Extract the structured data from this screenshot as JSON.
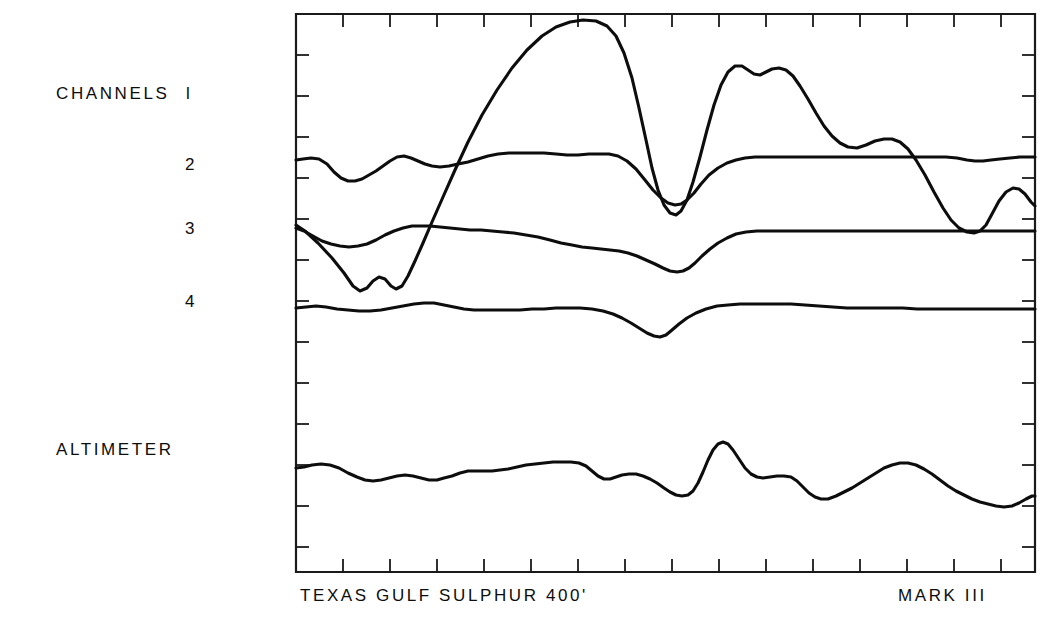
{
  "figure": {
    "kind": "multi-trace-strip-chart",
    "background_color": "#ffffff",
    "trace_color": "#0d0d0d"
  },
  "labels": {
    "channels_group": "CHANNELS",
    "channel_1": "l",
    "channel_2": "2",
    "channel_3": "3",
    "channel_4": "4",
    "altimeter": "ALTIMETER",
    "site_caption": "TEXAS  GULF  SULPHUR   400'",
    "system_caption": "MARK  III"
  },
  "chart_data": {
    "type": "line",
    "title": "",
    "subtitle": "",
    "xlabel": "TEXAS  GULF  SULPHUR   400'",
    "ylabel": "",
    "annotations": [
      "TEXAS  GULF  SULPHUR   400'",
      "MARK  III"
    ],
    "grid": false,
    "legend_position": "left-outside",
    "axes": {
      "frame": {
        "x0": 296,
        "y0": 14,
        "x1": 1035,
        "y1": 572
      },
      "x_ticks_count": 15,
      "x_tick_spacing_px": 47,
      "x_tick_direction": "inward-up",
      "y_ticks_count": 13,
      "y_tick_spacing_px": 41,
      "y_tick_direction": "inward-right",
      "xlim": [
        0,
        1
      ],
      "ylim": [
        0,
        1
      ],
      "tick_labels_x": [],
      "tick_labels_y": []
    },
    "legend_entries": [
      "CHANNELS l",
      "2",
      "3",
      "4",
      "ALTIMETER"
    ],
    "series": [
      {
        "name": "CHANNELS l",
        "baseline_y_px": 225,
        "path": "M296,225 L305,231 L318,243 L332,258 L344,273 L353,286 L360,291 L367,288 L373,281 L379,277 L385,279 L391,286 L396,289 L402,286 L408,276 L415,261 L423,243 L432,222 L443,197 L455,170 L468,142 L482,115 L497,90 L512,68 L527,50 L542,36 L556,27 L570,22 L583,20 L596,21 L607,26 L616,36 L624,53 L632,78 L639,108 L646,140 L652,168 L658,190 L664,205 L670,213 L676,215 L681,211 L687,200 L693,182 L700,157 L707,130 L714,105 L721,85 L728,72 L735,66 L742,66 L748,70 L754,74 L760,75 L766,72 L772,69 L779,68 L786,70 L793,76 L800,86 L808,99 L816,113 L824,126 L832,136 L840,143 L848,147 L857,148 L866,145 L875,141 L884,139 L892,139 L900,142 L908,149 L916,160 L925,175 L934,192 L943,208 L951,220 L959,228 L967,232 L974,233 L980,231 L986,225 L992,214 L999,201 L1006,192 L1013,188 L1019,189 L1025,194 L1031,202 L1035,206"
      },
      {
        "name": "2",
        "baseline_y_px": 160,
        "path": "M296,160 L303,159 L311,158 L319,159 L327,164 L334,172 L341,178 L348,181 L355,181 L362,179 L369,175 L376,171 L383,166 L390,161 L397,157 L404,156 L411,158 L418,161 L425,164 L432,166 L440,167 L449,166 L458,164 L468,162 L478,159 L488,156 L498,154 L509,153 L520,153 L532,153 L544,153 L556,154 L567,155 L578,155 L589,154 L599,154 L609,154 L618,156 L627,161 L636,169 L645,180 L653,190 L661,198 L668,203 L675,205 L681,204 L687,200 L694,193 L701,184 L709,175 L718,168 L727,163 L736,160 L745,158 L755,157 L766,157 L778,157 L791,157 L804,157 L817,157 L830,157 L843,157 L856,157 L869,157 L882,157 L895,157 L908,157 L921,157 L934,157 L946,157 L957,158 L967,160 L975,161 L983,161 L991,160 L1000,159 L1010,158 L1020,157 L1029,157 L1035,157"
      },
      {
        "name": "3",
        "baseline_y_px": 231,
        "path": "M296,228 L304,231 L313,236 L322,241 L331,244 L340,246 L349,247 L358,246 L367,244 L376,240 L385,235 L394,231 L403,228 L412,226 L421,226 L430,226 L440,227 L450,228 L460,229 L470,230 L481,230 L492,231 L503,232 L514,233 L526,235 L538,237 L550,240 L561,243 L572,245 L582,247 L592,248 L601,249 L610,250 L619,251 L628,253 L637,256 L646,260 L655,264 L663,268 L670,271 L677,272 L683,271 L689,268 L695,263 L702,256 L710,249 L718,243 L727,238 L736,234 L746,232 L757,231 L769,231 L782,231 L796,231 L810,231 L825,231 L840,231 L856,231 L872,231 L888,231 L904,231 L920,231 L936,231 L952,231 L968,231 L984,231 L1000,231 L1016,231 L1035,231"
      },
      {
        "name": "4",
        "baseline_y_px": 310,
        "path": "M296,308 L306,307 L316,306 L326,307 L337,309 L348,310 L359,311 L370,311 L381,310 L392,308 L403,306 L414,304 L424,303 L434,303 L444,305 L454,307 L464,309 L474,310 L485,310 L496,310 L508,310 L520,310 L532,309 L544,309 L556,308 L568,308 L580,308 L592,309 L603,311 L613,314 L622,318 L631,323 L639,328 L647,333 L654,336 L660,337 L666,335 L672,330 L679,324 L687,318 L696,313 L706,309 L717,306 L728,305 L740,304 L752,304 L765,304 L778,304 L791,304 L805,305 L819,306 L833,307 L847,308 L861,308 L875,308 L889,308 L903,308 L917,309 L931,309 L945,309 L959,309 L973,309 L987,309 L1001,309 L1015,309 L1035,309"
      },
      {
        "name": "ALTIMETER",
        "baseline_y_px": 470,
        "path": "M296,468 L304,467 L312,465 L321,464 L330,465 L339,468 L348,473 L357,477 L365,480 L373,481 L381,480 L389,478 L397,476 L405,475 L413,476 L421,478 L429,480 L437,480 L444,478 L452,476 L460,473 L468,471 L476,471 L484,471 L492,471 L500,470 L508,469 L517,467 L526,465 L535,464 L544,463 L553,462 L562,462 L571,462 L579,463 L586,466 L592,471 L598,476 L604,479 L610,479 L616,477 L622,475 L629,474 L636,474 L643,476 L650,479 L657,483 L664,488 L670,492 L676,495 L682,496 L688,495 L693,491 L698,483 L703,472 L708,460 L713,450 L718,444 L723,442 L728,444 L733,450 L739,459 L745,468 L751,474 L757,477 L763,478 L770,477 L777,476 L784,476 L791,477 L797,481 L803,487 L809,493 L815,497 L821,499 L828,499 L836,496 L844,492 L852,488 L860,483 L868,478 L876,473 L884,468 L892,465 L900,463 L908,463 L916,465 L924,469 L932,474 L940,480 L948,486 L956,491 L964,495 L972,499 L980,502 L988,504 L996,506 L1004,507 L1012,506 L1019,503 L1026,499 L1032,496 L1035,496"
      }
    ]
  }
}
